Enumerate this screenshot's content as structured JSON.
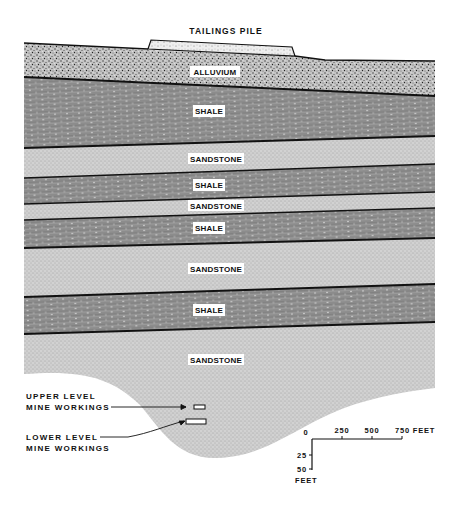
{
  "diagram": {
    "type": "geologic-cross-section",
    "title": "TAILINGS PILE",
    "colors": {
      "alluvium": "#bdbdbd",
      "shale": "#8a8a8a",
      "sandstone": "#cfcfcf",
      "boundary_line": "#111111",
      "label_background": "#ffffff"
    },
    "layers": [
      {
        "id": "tailings",
        "label": "TAILINGS PILE",
        "type": "tailings"
      },
      {
        "id": "alluvium",
        "label": "ALLUVIUM",
        "type": "alluvium"
      },
      {
        "id": "shale-1",
        "label": "SHALE",
        "type": "shale"
      },
      {
        "id": "sandstone-1",
        "label": "SANDSTONE",
        "type": "sandstone"
      },
      {
        "id": "shale-2",
        "label": "SHALE",
        "type": "shale"
      },
      {
        "id": "sandstone-2",
        "label": "SANDSTONE",
        "type": "sandstone"
      },
      {
        "id": "shale-3",
        "label": "SHALE",
        "type": "shale"
      },
      {
        "id": "sandstone-3",
        "label": "SANDSTONE",
        "type": "sandstone"
      },
      {
        "id": "shale-4",
        "label": "SHALE",
        "type": "shale"
      },
      {
        "id": "sandstone-4",
        "label": "SANDSTONE",
        "type": "sandstone"
      }
    ],
    "mine_workings": {
      "upper": {
        "line1": "UPPER LEVEL",
        "line2": "MINE WORKINGS"
      },
      "lower": {
        "line1": "LOWER LEVEL",
        "line2": "MINE WORKINGS"
      }
    },
    "scale": {
      "horizontal_ticks": [
        "0",
        "250",
        "500",
        "750 FEET"
      ],
      "vertical_ticks": [
        "25",
        "50"
      ],
      "vertical_unit": "FEET"
    }
  }
}
